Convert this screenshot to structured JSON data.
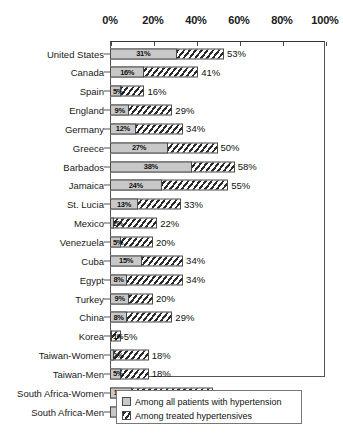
{
  "chart_data": {
    "type": "bar",
    "orientation": "horizontal",
    "title": "",
    "subtitle": "",
    "xlabel": "",
    "ylabel": "",
    "xlim": [
      0,
      100
    ],
    "xtick_labels": [
      "0%",
      "20%",
      "40%",
      "60%",
      "80%",
      "100%"
    ],
    "xticks": [
      0,
      20,
      40,
      60,
      80,
      100
    ],
    "grid": false,
    "axis_position": "top",
    "legend_position": "bottom-center",
    "categories": [
      "United States",
      "Canada",
      "Spain",
      "England",
      "Germany",
      "Greece",
      "Barbados",
      "Jamaica",
      "St. Lucia",
      "Mexico",
      "Venezuela",
      "Cuba",
      "Egypt",
      "Turkey",
      "China",
      "Korea",
      "Taiwan-Women",
      "Taiwan-Men",
      "South Africa-Women",
      "South Africa-Men"
    ],
    "series": [
      {
        "name": "Among all patients with hypertension",
        "style": "solid-gray",
        "color": "#c8c8c8",
        "values": [
          31,
          16,
          5,
          9,
          12,
          27,
          38,
          24,
          13,
          2,
          5,
          15,
          8,
          9,
          8,
          1,
          2,
          5,
          10,
          18
        ],
        "labels": [
          "31%",
          "16%",
          "5%",
          "9%",
          "12%",
          "27%",
          "38%",
          "24%",
          "13%",
          "2%",
          "5%",
          "15%",
          "8%",
          "9%",
          "8%",
          "1%",
          "2%",
          "5%",
          "10%",
          "18%"
        ]
      },
      {
        "name": "Among treated hypertensives",
        "style": "diagonal-hatch",
        "color": "#2b2b2b",
        "values": [
          53,
          41,
          16,
          29,
          34,
          50,
          58,
          55,
          33,
          22,
          20,
          34,
          34,
          20,
          29,
          5,
          18,
          18,
          48,
          50
        ],
        "labels": [
          "53%",
          "41%",
          "16%",
          "29%",
          "34%",
          "50%",
          "58%",
          "55%",
          "33%",
          "22%",
          "20%",
          "34%",
          "34%",
          "20%",
          "29%",
          "5%",
          "18%",
          "18%",
          "48%",
          "50%"
        ]
      }
    ]
  },
  "legend": {
    "items": [
      {
        "label": "Among all patients with hypertension",
        "swatch": "solid-gray-swatch"
      },
      {
        "label": "Among treated hypertensives",
        "swatch": "hatched-swatch"
      }
    ]
  }
}
